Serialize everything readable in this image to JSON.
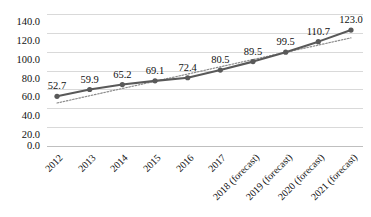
{
  "chart_data": {
    "type": "line",
    "title": "",
    "subtitle": "",
    "xlabel": "",
    "ylabel": "",
    "categories": [
      "2012",
      "2013",
      "2014",
      "2015",
      "2016",
      "2017",
      "2018 (forecast)",
      "2019 (forecast)",
      "2020 (forecast)",
      "2021 (forecast)"
    ],
    "values": [
      52.7,
      59.9,
      65.2,
      69.1,
      72.4,
      80.5,
      89.5,
      99.5,
      110.7,
      123.0
    ],
    "data_labels": [
      "52.7",
      "59.9",
      "65.2",
      "69.1",
      "72.4",
      "80.5",
      "89.5",
      "99.5",
      "110.7",
      "123.0"
    ],
    "series": [
      {
        "name": "Series 1",
        "values": [
          52.7,
          59.9,
          65.2,
          69.1,
          72.4,
          80.5,
          89.5,
          99.5,
          110.7,
          123.0
        ],
        "style": "solid-line-with-round-markers",
        "color": "#595959"
      },
      {
        "name": "Linear trendline",
        "values": [
          45.6,
          53.3,
          61.0,
          68.6,
          76.3,
          84.0,
          91.7,
          99.4,
          107.0,
          114.7
        ],
        "style": "dotted-line",
        "color": "#8c8c8c"
      }
    ],
    "ylim": [
      0,
      140
    ],
    "ytick_values": [
      0,
      20,
      40,
      60,
      80,
      100,
      120,
      140
    ],
    "ytick_labels": [
      "0.0",
      "20.0",
      "40.0",
      "60.0",
      "80.0",
      "100.0",
      "120.0",
      "140.0"
    ],
    "xlim": [
      0,
      9
    ],
    "grid": {
      "horizontal": true,
      "vertical": false,
      "color": "#d9d9d9"
    },
    "legend": {
      "visible": false,
      "position": "none",
      "entries": []
    },
    "annotations": [],
    "axis_line": {
      "x_axis_visible": true,
      "y_axis_visible": false
    }
  },
  "colors": {
    "series_line": "#595959",
    "marker": "#595959",
    "trendline": "#8c8c8c",
    "gridline": "#d9d9d9",
    "text": "#111111",
    "background": "#ffffff"
  }
}
